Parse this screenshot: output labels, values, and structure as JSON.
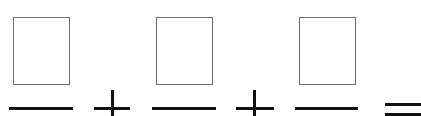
{
  "expression": {
    "terms": [
      {
        "box_value": "",
        "denominator": ""
      },
      {
        "box_value": "",
        "denominator": ""
      },
      {
        "box_value": "",
        "denominator": ""
      }
    ],
    "operators": [
      "+",
      "+"
    ],
    "result_sign": "=",
    "colors": {
      "box_border": "#6e6e6e",
      "stroke": "#111111"
    }
  }
}
